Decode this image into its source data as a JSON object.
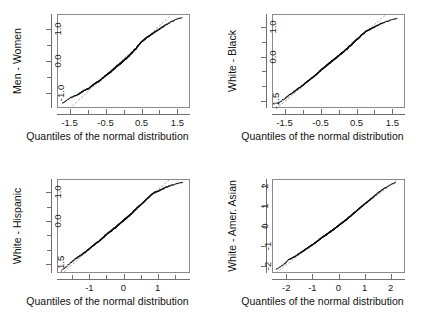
{
  "figure": {
    "title": "",
    "background": "#ffffff",
    "panel_count": 4,
    "point_color": "#101010",
    "refline_color": "#9a9a9a",
    "frame_color": "#8a8a8a"
  },
  "chart_data": [
    {
      "type": "scatter",
      "subtype": "qq-plot",
      "title": "",
      "xlabel": "Quantiles of the normal distribution",
      "ylabel": "Men - Women",
      "xlim": [
        -1.85,
        1.85
      ],
      "ylim": [
        -1.45,
        1.45
      ],
      "grid": false,
      "legend": null,
      "xticks": [
        -1.5,
        -1.0,
        -0.5,
        0.0,
        0.5,
        1.0,
        1.5
      ],
      "xticklabels": [
        "-1.5",
        "",
        "-0.5",
        "",
        "0.5",
        "",
        "1.5"
      ],
      "yticks": [
        -1.0,
        -0.5,
        0.0,
        0.5,
        1.0
      ],
      "yticklabels": [
        "-1.0",
        "",
        "0.0",
        "",
        "1.0"
      ],
      "annotations": [
        "dashed gray reference line through quartiles"
      ],
      "x": [
        -1.72,
        -1.51,
        -1.38,
        -1.28,
        -1.2,
        -1.13,
        -1.06,
        -1.0,
        -0.95,
        -0.9,
        -0.85,
        -0.8,
        -0.76,
        -0.72,
        -0.68,
        -0.64,
        -0.6,
        -0.57,
        -0.53,
        -0.5,
        -0.46,
        -0.43,
        -0.4,
        -0.37,
        -0.34,
        -0.31,
        -0.28,
        -0.25,
        -0.22,
        -0.19,
        -0.16,
        -0.13,
        -0.1,
        -0.07,
        -0.04,
        -0.01,
        0.02,
        0.05,
        0.08,
        0.11,
        0.14,
        0.17,
        0.2,
        0.23,
        0.26,
        0.29,
        0.32,
        0.36,
        0.39,
        0.42,
        0.46,
        0.49,
        0.53,
        0.57,
        0.61,
        0.65,
        0.7,
        0.75,
        0.8,
        0.86,
        0.92,
        0.99,
        1.07,
        1.17,
        1.29,
        1.44,
        1.65
      ],
      "y": [
        -1.32,
        -1.16,
        -1.1,
        -1.05,
        -0.99,
        -0.94,
        -0.9,
        -0.88,
        -0.84,
        -0.79,
        -0.74,
        -0.71,
        -0.68,
        -0.65,
        -0.62,
        -0.59,
        -0.55,
        -0.52,
        -0.49,
        -0.46,
        -0.43,
        -0.4,
        -0.37,
        -0.35,
        -0.32,
        -0.29,
        -0.26,
        -0.23,
        -0.2,
        -0.17,
        -0.14,
        -0.12,
        -0.09,
        -0.06,
        -0.03,
        0.0,
        0.03,
        0.06,
        0.08,
        0.12,
        0.15,
        0.18,
        0.22,
        0.25,
        0.29,
        0.32,
        0.36,
        0.4,
        0.45,
        0.49,
        0.54,
        0.58,
        0.62,
        0.66,
        0.7,
        0.73,
        0.77,
        0.81,
        0.85,
        0.89,
        0.94,
        0.99,
        1.05,
        1.12,
        1.2,
        1.29,
        1.37
      ]
    },
    {
      "type": "scatter",
      "subtype": "qq-plot",
      "title": "",
      "xlabel": "Quantiles of the normal distribution",
      "ylabel": "White - Black",
      "xlim": [
        -1.85,
        1.85
      ],
      "ylim": [
        -1.75,
        1.45
      ],
      "grid": false,
      "legend": null,
      "xticks": [
        -1.5,
        -1.0,
        -0.5,
        0.0,
        0.5,
        1.0,
        1.5
      ],
      "xticklabels": [
        "-1.5",
        "",
        "-0.5",
        "",
        "0.5",
        "",
        "1.5"
      ],
      "yticks": [
        -1.5,
        -1.0,
        -0.5,
        0.0,
        0.5,
        1.0
      ],
      "yticklabels": [
        "-1.5",
        "",
        "",
        "0.0",
        "",
        "1.0"
      ],
      "annotations": [
        "dashed gray reference line through quartiles"
      ],
      "x": [
        -1.72,
        -1.51,
        -1.38,
        -1.28,
        -1.2,
        -1.13,
        -1.06,
        -1.0,
        -0.95,
        -0.9,
        -0.85,
        -0.8,
        -0.76,
        -0.72,
        -0.68,
        -0.64,
        -0.6,
        -0.57,
        -0.53,
        -0.5,
        -0.46,
        -0.43,
        -0.4,
        -0.37,
        -0.34,
        -0.31,
        -0.28,
        -0.25,
        -0.22,
        -0.19,
        -0.16,
        -0.13,
        -0.1,
        -0.07,
        -0.04,
        -0.01,
        0.02,
        0.05,
        0.08,
        0.11,
        0.14,
        0.17,
        0.2,
        0.23,
        0.26,
        0.29,
        0.32,
        0.36,
        0.39,
        0.42,
        0.46,
        0.49,
        0.53,
        0.57,
        0.61,
        0.65,
        0.7,
        0.75,
        0.8,
        0.86,
        0.92,
        0.99,
        1.07,
        1.17,
        1.29,
        1.44,
        1.65
      ],
      "y": [
        -1.62,
        -1.45,
        -1.32,
        -1.24,
        -1.16,
        -1.1,
        -1.04,
        -0.99,
        -0.93,
        -0.88,
        -0.83,
        -0.79,
        -0.75,
        -0.71,
        -0.67,
        -0.63,
        -0.59,
        -0.55,
        -0.51,
        -0.47,
        -0.44,
        -0.4,
        -0.37,
        -0.34,
        -0.31,
        -0.28,
        -0.25,
        -0.22,
        -0.19,
        -0.16,
        -0.13,
        -0.1,
        -0.07,
        -0.04,
        -0.01,
        0.02,
        0.05,
        0.08,
        0.11,
        0.14,
        0.17,
        0.2,
        0.24,
        0.27,
        0.3,
        0.34,
        0.37,
        0.41,
        0.45,
        0.49,
        0.53,
        0.57,
        0.61,
        0.65,
        0.7,
        0.75,
        0.8,
        0.86,
        0.9,
        0.93,
        0.97,
        1.02,
        1.07,
        1.13,
        1.19,
        1.26,
        1.33
      ]
    },
    {
      "type": "scatter",
      "subtype": "qq-plot",
      "title": "",
      "xlabel": "Quantiles of the normal distribution",
      "ylabel": "White - Hispanic",
      "xlim": [
        -1.95,
        1.95
      ],
      "ylim": [
        -1.8,
        1.45
      ],
      "grid": false,
      "legend": null,
      "xticks": [
        -1.5,
        -1.0,
        -0.5,
        0.0,
        0.5,
        1.0,
        1.5
      ],
      "xticklabels": [
        "",
        "-1",
        "",
        "0",
        "",
        "1",
        ""
      ],
      "yticks": [
        -1.5,
        -1.0,
        -0.5,
        0.0,
        0.5,
        1.0
      ],
      "yticklabels": [
        "-1.5",
        "",
        "",
        "0.0",
        "",
        "1.0"
      ],
      "annotations": [
        "dashed gray reference line through quartiles"
      ],
      "x": [
        -1.8,
        -1.58,
        -1.44,
        -1.34,
        -1.25,
        -1.17,
        -1.1,
        -1.04,
        -0.98,
        -0.93,
        -0.88,
        -0.83,
        -0.79,
        -0.74,
        -0.7,
        -0.66,
        -0.62,
        -0.58,
        -0.55,
        -0.51,
        -0.47,
        -0.44,
        -0.41,
        -0.37,
        -0.34,
        -0.31,
        -0.28,
        -0.25,
        -0.22,
        -0.19,
        -0.16,
        -0.13,
        -0.1,
        -0.07,
        -0.04,
        -0.01,
        0.02,
        0.05,
        0.08,
        0.11,
        0.14,
        0.17,
        0.2,
        0.23,
        0.27,
        0.3,
        0.33,
        0.37,
        0.4,
        0.44,
        0.48,
        0.52,
        0.56,
        0.6,
        0.64,
        0.69,
        0.74,
        0.79,
        0.85,
        0.91,
        0.98,
        1.05,
        1.14,
        1.24,
        1.37,
        1.53,
        1.76
      ],
      "y": [
        -1.7,
        -1.48,
        -1.34,
        -1.26,
        -1.19,
        -1.12,
        -1.06,
        -1.0,
        -0.94,
        -0.89,
        -0.84,
        -0.8,
        -0.76,
        -0.72,
        -0.68,
        -0.64,
        -0.6,
        -0.56,
        -0.52,
        -0.48,
        -0.44,
        -0.41,
        -0.38,
        -0.35,
        -0.32,
        -0.29,
        -0.26,
        -0.24,
        -0.21,
        -0.18,
        -0.14,
        -0.11,
        -0.08,
        -0.05,
        -0.02,
        0.01,
        0.04,
        0.07,
        0.1,
        0.13,
        0.16,
        0.19,
        0.23,
        0.26,
        0.3,
        0.34,
        0.38,
        0.42,
        0.46,
        0.5,
        0.54,
        0.58,
        0.62,
        0.67,
        0.72,
        0.77,
        0.83,
        0.89,
        0.95,
        1.0,
        1.03,
        1.07,
        1.12,
        1.18,
        1.24,
        1.3,
        1.37
      ]
    },
    {
      "type": "scatter",
      "subtype": "qq-plot",
      "title": "",
      "xlabel": "Quantiles of the normal distribution",
      "ylabel": "White - Amer. Asian",
      "xlim": [
        -2.55,
        2.55
      ],
      "ylim": [
        -2.35,
        2.35
      ],
      "grid": false,
      "legend": null,
      "xticks": [
        -2,
        -1,
        0,
        1,
        2
      ],
      "xticklabels": [
        "-2",
        "-1",
        "0",
        "1",
        "2"
      ],
      "yticks": [
        -2,
        -1,
        0,
        1,
        2
      ],
      "yticklabels": [
        "-2",
        "-1",
        "0",
        "1",
        "2"
      ],
      "annotations": [
        "dashed gray reference line through quartiles"
      ],
      "x": [
        -2.42,
        -2.12,
        -1.93,
        -1.79,
        -1.67,
        -1.57,
        -1.48,
        -1.39,
        -1.32,
        -1.25,
        -1.18,
        -1.12,
        -1.06,
        -1.0,
        -0.94,
        -0.89,
        -0.83,
        -0.78,
        -0.73,
        -0.68,
        -0.63,
        -0.59,
        -0.54,
        -0.5,
        -0.45,
        -0.41,
        -0.37,
        -0.33,
        -0.29,
        -0.25,
        -0.21,
        -0.17,
        -0.13,
        -0.09,
        -0.05,
        -0.01,
        0.03,
        0.07,
        0.11,
        0.15,
        0.19,
        0.23,
        0.27,
        0.31,
        0.35,
        0.39,
        0.43,
        0.48,
        0.52,
        0.57,
        0.61,
        0.66,
        0.71,
        0.76,
        0.81,
        0.87,
        0.93,
        0.99,
        1.06,
        1.14,
        1.22,
        1.31,
        1.42,
        1.55,
        1.71,
        1.92,
        2.21
      ],
      "y": [
        -2.2,
        -1.95,
        -1.71,
        -1.62,
        -1.54,
        -1.44,
        -1.36,
        -1.29,
        -1.22,
        -1.16,
        -1.1,
        -1.05,
        -1.0,
        -0.94,
        -0.89,
        -0.84,
        -0.78,
        -0.73,
        -0.68,
        -0.63,
        -0.58,
        -0.54,
        -0.5,
        -0.46,
        -0.42,
        -0.38,
        -0.34,
        -0.31,
        -0.27,
        -0.23,
        -0.19,
        -0.15,
        -0.11,
        -0.07,
        -0.03,
        0.01,
        0.05,
        0.09,
        0.13,
        0.17,
        0.21,
        0.25,
        0.29,
        0.33,
        0.38,
        0.42,
        0.47,
        0.52,
        0.57,
        0.62,
        0.67,
        0.72,
        0.78,
        0.84,
        0.9,
        0.96,
        1.03,
        1.1,
        1.17,
        1.25,
        1.34,
        1.44,
        1.56,
        1.7,
        1.86,
        2.03,
        2.22
      ]
    }
  ]
}
